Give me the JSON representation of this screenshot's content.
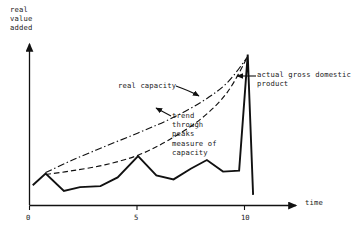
{
  "chart_data": {
    "type": "line",
    "title": "",
    "xlabel": "time",
    "ylabel": "real\nvalue\nadded",
    "xlim": [
      0,
      13.5
    ],
    "ylim": [
      0,
      10
    ],
    "grid": false,
    "legend": "annotations",
    "x_ticks": [
      "0",
      "5",
      "10"
    ],
    "x_tick_values": [
      0,
      5,
      10
    ],
    "y_ticks": [],
    "annotations": [
      {
        "name": "real-capacity",
        "text": "real capacity",
        "target_series": "real capacity"
      },
      {
        "name": "actual-gross-domestic-product",
        "text": "actual gross domestic\nproduct",
        "target_series": "actual gross domestic product"
      },
      {
        "name": "trend-through-peaks",
        "text": "trend\nthrough\npeaks\nmeasure of\ncapacity",
        "target_series": "trend through peaks measure of capacity"
      }
    ],
    "series": [
      {
        "name": "actual gross domestic product",
        "style": "solid",
        "color": "#111111",
        "x": [
          0.15,
          0.75,
          1.6,
          2.35,
          3.3,
          4.1,
          5.05,
          5.9,
          6.7,
          7.5,
          8.25,
          9.0,
          9.75,
          10.15,
          10.4
        ],
        "y": [
          1.05,
          1.65,
          0.75,
          0.95,
          1.0,
          1.45,
          2.55,
          1.55,
          1.35,
          1.9,
          2.35,
          1.75,
          1.8,
          7.8,
          0.55
        ]
      },
      {
        "name": "real capacity",
        "style": "dash-dot",
        "color": "#111111",
        "x": [
          0.75,
          2.0,
          3.5,
          5.05,
          6.5,
          8.0,
          9.2,
          10.15
        ],
        "y": [
          1.7,
          2.35,
          3.05,
          3.75,
          4.45,
          5.35,
          6.35,
          7.7
        ]
      },
      {
        "name": "trend through peaks measure of capacity",
        "style": "dashed",
        "color": "#111111",
        "x": [
          0.75,
          2.0,
          3.5,
          5.05,
          6.5,
          8.0,
          9.2,
          10.15
        ],
        "y": [
          1.6,
          1.8,
          2.1,
          2.6,
          3.4,
          4.5,
          5.85,
          7.7
        ]
      }
    ]
  },
  "axes": {
    "y_axis_title": "real\nvalue\nadded",
    "x_axis_title": "time",
    "tick_labels": [
      "0",
      "5",
      "10"
    ]
  },
  "labels": {
    "real_capacity": "real capacity",
    "actual_gdp_line1": "actual gross domestic",
    "actual_gdp_line2": "product",
    "trend_line1": "trend",
    "trend_line2": "through",
    "trend_line3": "peaks",
    "trend_line4": "measure of",
    "trend_line5": "capacity"
  },
  "colors": {
    "ink": "#111111",
    "background": "#ffffff"
  }
}
